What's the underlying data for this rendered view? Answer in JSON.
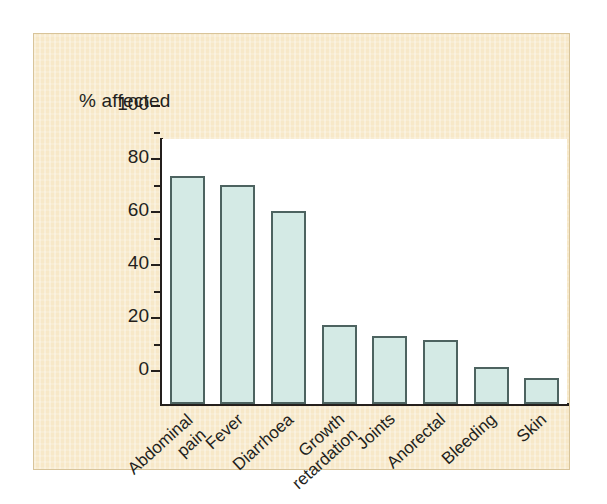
{
  "chart_data": {
    "type": "bar",
    "title": "",
    "xlabel": "",
    "ylabel": "% affected",
    "ylim": [
      0,
      100
    ],
    "ytick_labels": [
      "0",
      "20",
      "40",
      "60",
      "80",
      "100"
    ],
    "ytick_values": [
      0,
      20,
      40,
      60,
      80,
      100
    ],
    "minor_tick_interval": 10,
    "grid": false,
    "legend": "none",
    "categories": [
      "Abdominal pain",
      "Fever",
      "Diarrhoea",
      "Growth retardation",
      "Joints",
      "Anorectal",
      "Bleeding",
      "Skin"
    ],
    "category_lines": [
      [
        "Abdominal",
        "pain"
      ],
      [
        "Fever",
        ""
      ],
      [
        "Diarrhoea",
        ""
      ],
      [
        "Growth",
        "retardation"
      ],
      [
        "Joints",
        ""
      ],
      [
        "Anorectal",
        ""
      ],
      [
        "Bleeding",
        ""
      ],
      [
        "Skin",
        ""
      ]
    ],
    "values": [
      86,
      82.5,
      73,
      30,
      25.5,
      24,
      14,
      10
    ],
    "bar_fill_color": "#d4eae5",
    "bar_edge_color": "#4d6360",
    "panel_color": "#f7e8c8",
    "plot_background": "#ffffff",
    "axis_color": "#241f1c"
  }
}
